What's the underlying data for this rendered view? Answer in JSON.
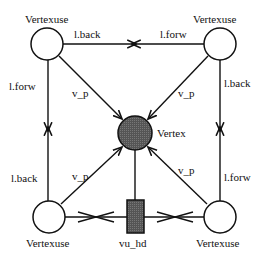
{
  "diagram": {
    "type": "data-structure graph",
    "colors": {
      "line": "#111111",
      "vertex_fill": "#5a5a5a",
      "hd_fill": "#4a4a4a",
      "hollow_fill": "#ffffff"
    },
    "nodes": {
      "top_left": {
        "label": "Vertexuse"
      },
      "top_right": {
        "label": "Vertexuse"
      },
      "bottom_left": {
        "label": "Vertexuse"
      },
      "bottom_right": {
        "label": "Vertexuse"
      },
      "center": {
        "label": "Vertex"
      },
      "hd": {
        "label": "vu_hd"
      }
    },
    "edges": {
      "top_left_right": "l.back",
      "top_right_left": "l.forw",
      "left_top_down": "l.forw",
      "left_bottom_up": "l.back",
      "right_top_down": "l.back",
      "right_bottom_up": "l.forw",
      "tl_vp": "v_p",
      "tr_vp": "v_p",
      "bl_vp": "v_p",
      "br_vp": "v_p"
    }
  }
}
